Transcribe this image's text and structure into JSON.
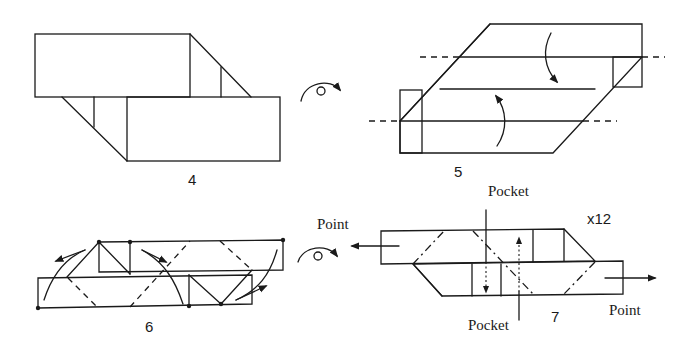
{
  "diagram": {
    "type": "origami-instructions",
    "steps": [
      {
        "number": "4",
        "description": "Two overlapping offset rectangles with angled folds"
      },
      {
        "number": "5",
        "description": "Parallelogram with valley folds (dashed) and fold-direction arrows"
      },
      {
        "number": "6",
        "description": "Unit with fold arrows and dashed crease lines"
      },
      {
        "number": "7",
        "description": "Finished unit showing points and pockets"
      }
    ],
    "labels": {
      "step4": "4",
      "step5": "5",
      "step6": "6",
      "step7": "7",
      "point_left": "Point",
      "point_right": "Point",
      "pocket_top": "Pocket",
      "pocket_bottom": "Pocket",
      "multiplier": "x12"
    },
    "symbols": [
      {
        "name": "turn-over-icon",
        "between": "4-5"
      },
      {
        "name": "turn-over-icon",
        "between": "6-7"
      }
    ],
    "colors": {
      "ink": "#1a1a1a",
      "paper": "#ffffff"
    }
  }
}
